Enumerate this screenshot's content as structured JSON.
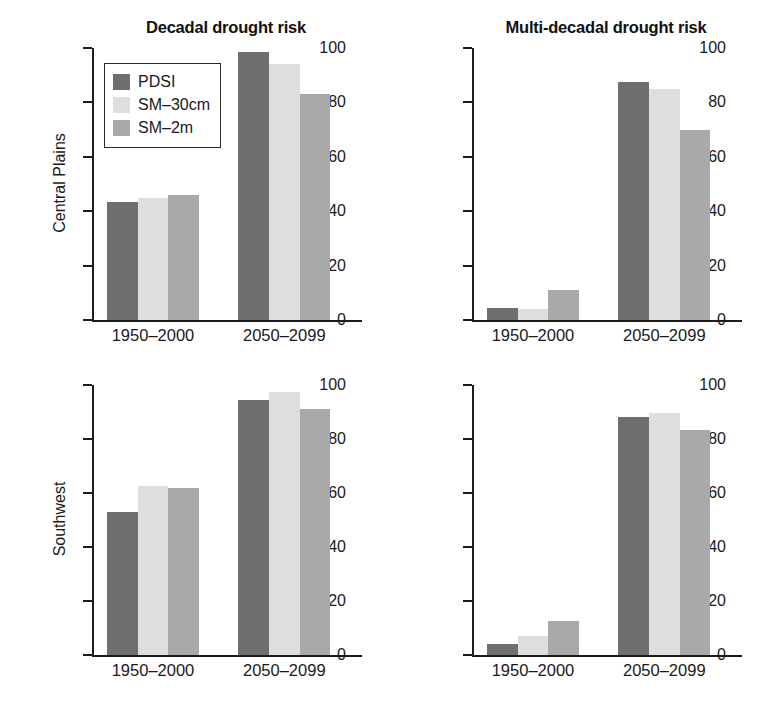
{
  "figure": {
    "width": 780,
    "height": 720,
    "background": "#ffffff"
  },
  "series_colors": {
    "PDSI": "#6f6f6f",
    "SM-30cm": "#dedede",
    "SM-2m": "#a9a9a9"
  },
  "legend": {
    "position": "top-left of first panel",
    "items": [
      {
        "label": "PDSI",
        "color": "#6f6f6f",
        "swatch": "legend-swatch-pdsi"
      },
      {
        "label": "SM–30cm",
        "color": "#dedede",
        "swatch": "legend-swatch-sm30cm"
      },
      {
        "label": "SM–2m",
        "color": "#a9a9a9",
        "swatch": "legend-swatch-sm2m"
      }
    ]
  },
  "row_labels": [
    {
      "label": "Central Plains"
    },
    {
      "label": "Southwest"
    }
  ],
  "column_titles": [
    {
      "label": "Decadal drought risk"
    },
    {
      "label": "Multi-decadal drought risk"
    }
  ],
  "axis": {
    "ylim": [
      0,
      100
    ],
    "yticks": [
      0,
      20,
      40,
      60,
      80,
      100
    ],
    "ytick_labels": [
      "0",
      "20",
      "40",
      "60",
      "80",
      "100"
    ],
    "ylabel": "",
    "xlabel": "",
    "grid": false
  },
  "categories": [
    "1950–2000",
    "2050–2099"
  ],
  "chart_data": [
    {
      "id": "central-plains-decadal",
      "type": "bar",
      "title": "Decadal drought risk",
      "row": "Central Plains",
      "xlabel": "",
      "ylabel": "Central Plains",
      "ylim": [
        0,
        100
      ],
      "yticks": [
        0,
        20,
        40,
        60,
        80,
        100
      ],
      "grid": false,
      "legend_position": "upper left",
      "categories": [
        "1950–2000",
        "2050–2099"
      ],
      "series": [
        {
          "name": "PDSI",
          "color": "#6f6f6f",
          "values": [
            43.5,
            98.5
          ]
        },
        {
          "name": "SM–30cm",
          "color": "#dedede",
          "values": [
            45.0,
            94.0
          ]
        },
        {
          "name": "SM–2m",
          "color": "#a9a9a9",
          "values": [
            46.0,
            83.0
          ]
        }
      ]
    },
    {
      "id": "central-plains-multidecadal",
      "type": "bar",
      "title": "Multi-decadal drought risk",
      "row": "Central Plains",
      "xlabel": "",
      "ylabel": "",
      "ylim": [
        0,
        100
      ],
      "yticks": [
        0,
        20,
        40,
        60,
        80,
        100
      ],
      "grid": false,
      "legend_position": "none",
      "categories": [
        "1950–2000",
        "2050–2099"
      ],
      "series": [
        {
          "name": "PDSI",
          "color": "#6f6f6f",
          "values": [
            4.5,
            87.5
          ]
        },
        {
          "name": "SM–30cm",
          "color": "#dedede",
          "values": [
            4.0,
            85.0
          ]
        },
        {
          "name": "SM–2m",
          "color": "#a9a9a9",
          "values": [
            11.0,
            70.0
          ]
        }
      ]
    },
    {
      "id": "southwest-decadal",
      "type": "bar",
      "title": "",
      "row": "Southwest",
      "xlabel": "",
      "ylabel": "Southwest",
      "ylim": [
        0,
        100
      ],
      "yticks": [
        0,
        20,
        40,
        60,
        80,
        100
      ],
      "grid": false,
      "legend_position": "none",
      "categories": [
        "1950–2000",
        "2050–2099"
      ],
      "series": [
        {
          "name": "PDSI",
          "color": "#6f6f6f",
          "values": [
            53.0,
            94.5
          ]
        },
        {
          "name": "SM–30cm",
          "color": "#dedede",
          "values": [
            62.5,
            97.5
          ]
        },
        {
          "name": "SM–2m",
          "color": "#a9a9a9",
          "values": [
            62.0,
            91.0
          ]
        }
      ]
    },
    {
      "id": "southwest-multidecadal",
      "type": "bar",
      "title": "",
      "row": "Southwest",
      "xlabel": "",
      "ylabel": "",
      "ylim": [
        0,
        100
      ],
      "yticks": [
        0,
        20,
        40,
        60,
        80,
        100
      ],
      "grid": false,
      "legend_position": "none",
      "categories": [
        "1950–2000",
        "2050–2099"
      ],
      "series": [
        {
          "name": "PDSI",
          "color": "#6f6f6f",
          "values": [
            4.0,
            88.0
          ]
        },
        {
          "name": "SM–30cm",
          "color": "#dedede",
          "values": [
            7.0,
            89.5
          ]
        },
        {
          "name": "SM–2m",
          "color": "#a9a9a9",
          "values": [
            12.5,
            83.5
          ]
        }
      ]
    }
  ]
}
